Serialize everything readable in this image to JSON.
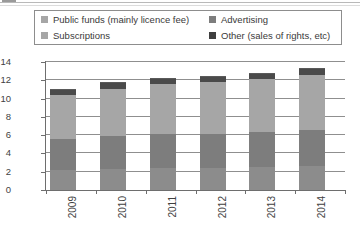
{
  "chart_data": {
    "type": "bar",
    "subtype": "stacked-column",
    "title": "",
    "subtitle": "",
    "xlabel": "",
    "ylabel": "",
    "categories": [
      "2009",
      "2010",
      "2011",
      "2012",
      "2013",
      "2014"
    ],
    "ylim": [
      0,
      14
    ],
    "yticks": [
      0,
      2,
      4,
      6,
      8,
      10,
      12,
      14
    ],
    "ytick_labels": [
      "0",
      "2",
      "4",
      "6",
      "8",
      "10",
      "12",
      "14"
    ],
    "grid": true,
    "grid_axis": "y",
    "legend_position": "top",
    "xtick_label_rotation": 90,
    "series": [
      {
        "name": "Subscriptions",
        "color": "#8c8c8c",
        "values": [
          2.2,
          2.3,
          2.4,
          2.4,
          2.5,
          2.6
        ]
      },
      {
        "name": "Advertising",
        "color": "#7d7d7d",
        "values": [
          3.4,
          3.6,
          3.7,
          3.7,
          3.8,
          4.0
        ]
      },
      {
        "name": "Public funds (mainly licence fee)",
        "color": "#a6a6a6",
        "values": [
          4.8,
          5.2,
          5.5,
          5.7,
          5.8,
          6.0
        ]
      },
      {
        "name": "Other (sales of rights, etc)",
        "color": "#4a4a4a",
        "values": [
          0.6,
          0.7,
          0.7,
          0.7,
          0.7,
          0.7
        ]
      }
    ],
    "totals": [
      11.0,
      11.8,
      12.3,
      12.5,
      12.8,
      13.3
    ]
  },
  "legend": {
    "entries": [
      {
        "label": "Public funds (mainly licence fee)",
        "color": "#a6a6a6"
      },
      {
        "label": "Advertising",
        "color": "#7d7d7d"
      },
      {
        "label": "Subscriptions",
        "color": "#a6a6a6"
      },
      {
        "label": "Other (sales of rights, etc)",
        "color": "#3f3f3f"
      }
    ]
  },
  "colors": {
    "axis": "#6e6e6e",
    "grid": "#8f8f8f",
    "text": "#3f3f3f",
    "legend_border": "#8d8d8d",
    "background": "#ffffff"
  }
}
